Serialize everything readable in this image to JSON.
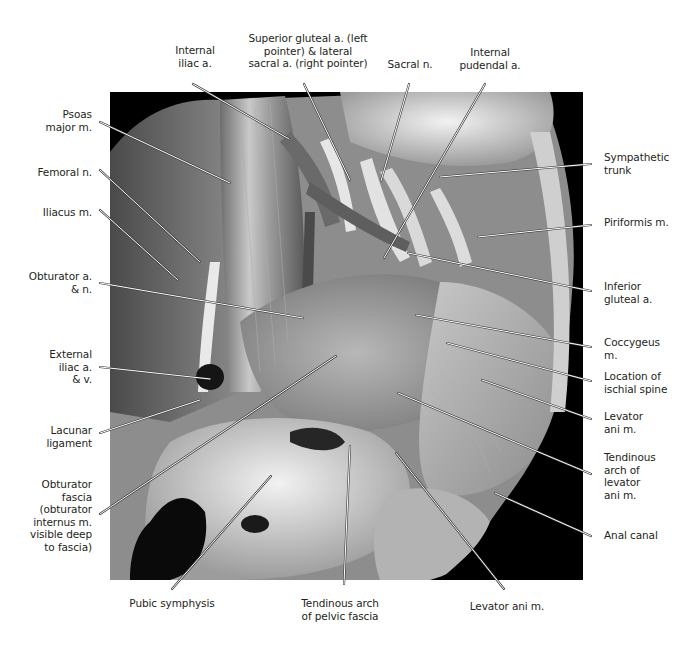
{
  "figure": {
    "colors": {
      "background": "#ffffff",
      "text": "#231f20",
      "leader": "#ffffff",
      "leader_outline": "#3a3a3a",
      "photo_frame": "#000000"
    }
  },
  "labels": {
    "top": [
      {
        "id": "internal-iliac-a",
        "text": "Internal\niliac a."
      },
      {
        "id": "superior-gluteal-lateral-sacral",
        "text": "Superior gluteal a. (left\npointer) & lateral\nsacral a. (right pointer)"
      },
      {
        "id": "sacral-n",
        "text": "Sacral n."
      },
      {
        "id": "internal-pudendal-a",
        "text": "Internal\npudendal a."
      }
    ],
    "left": [
      {
        "id": "psoas-major-m",
        "text": "Psoas\nmajor m."
      },
      {
        "id": "femoral-n",
        "text": "Femoral n."
      },
      {
        "id": "iliacus-m",
        "text": "Iliacus m."
      },
      {
        "id": "obturator-a-n",
        "text": "Obturator a.\n& n."
      },
      {
        "id": "external-iliac-a-v",
        "text": "External\niliac a.\n& v."
      },
      {
        "id": "lacunar-ligament",
        "text": "Lacunar\nligament"
      },
      {
        "id": "obturator-fascia",
        "text": "Obturator\nfascia\n(obturator\ninternus m.\nvisible deep\nto fascia)"
      }
    ],
    "right": [
      {
        "id": "sympathetic-trunk",
        "text": "Sympathetic\ntrunk"
      },
      {
        "id": "piriformis-m",
        "text": "Piriformis m."
      },
      {
        "id": "inferior-gluteal-a",
        "text": "Inferior\ngluteal a."
      },
      {
        "id": "coccygeus-m",
        "text": "Coccygeus\nm."
      },
      {
        "id": "location-ischial-spine",
        "text": "Location of\nischial spine"
      },
      {
        "id": "levator-ani-m-right",
        "text": "Levator\nani m."
      },
      {
        "id": "tendinous-arch-levator-ani",
        "text": "Tendinous\narch of\nlevator\nani m."
      },
      {
        "id": "anal-canal",
        "text": "Anal canal"
      }
    ],
    "bottom": [
      {
        "id": "pubic-symphysis",
        "text": "Pubic symphysis"
      },
      {
        "id": "tendinous-arch-pelvic-fascia",
        "text": "Tendinous arch\nof pelvic fascia"
      },
      {
        "id": "levator-ani-m-bottom",
        "text": "Levator ani m."
      }
    ]
  }
}
